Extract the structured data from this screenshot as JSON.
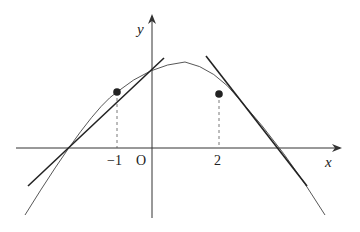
{
  "diagram": {
    "type": "function-graph-with-tangents",
    "axes": {
      "x_label": "x",
      "y_label": "y",
      "origin_label": "O"
    },
    "ticks": [
      {
        "value": -1,
        "label": "−1"
      },
      {
        "value": 2,
        "label": "2"
      }
    ],
    "points": [
      {
        "x": -1,
        "note": "tangent point on curve"
      },
      {
        "x": 2,
        "note": "tangent point on curve"
      }
    ],
    "curve": {
      "shape": "concave-down, peak slightly right of y-axis"
    },
    "tangent_lines": [
      {
        "at_x": -1,
        "slope_sign": "positive"
      },
      {
        "at_x": 2,
        "slope_sign": "negative"
      }
    ],
    "colors": {
      "curve": "#333333",
      "tangent": "#222222",
      "axes": "#333333",
      "background": "#ffffff"
    }
  }
}
